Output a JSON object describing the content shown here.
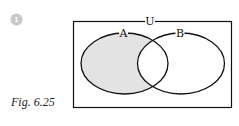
{
  "marker": {
    "number": "1",
    "color": "#c8c8c8"
  },
  "figure": {
    "caption": "Fig. 6.25"
  },
  "venn": {
    "universe_label": "U",
    "sets": [
      {
        "label": "A",
        "shaded": true,
        "region": "A only (A minus B)"
      },
      {
        "label": "B",
        "shaded": false
      }
    ],
    "shade_color": "#e3e3e3",
    "stroke_color": "#111111"
  }
}
